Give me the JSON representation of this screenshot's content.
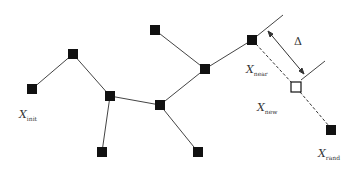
{
  "diagram": {
    "labels": {
      "x_init": {
        "main": "X",
        "sub": "init"
      },
      "x_near": {
        "main": "X",
        "sub": "near"
      },
      "x_new": {
        "main": "X",
        "sub": "new"
      },
      "x_rand": {
        "main": "X",
        "sub": "rand"
      },
      "delta": "Δ"
    },
    "nodes": [
      {
        "id": "n1",
        "x": 32,
        "y": 89
      },
      {
        "id": "n2",
        "x": 73,
        "y": 54
      },
      {
        "id": "n3",
        "x": 110,
        "y": 96
      },
      {
        "id": "n4",
        "x": 102,
        "y": 152
      },
      {
        "id": "n5",
        "x": 160,
        "y": 105
      },
      {
        "id": "n6",
        "x": 155,
        "y": 30
      },
      {
        "id": "n7",
        "x": 205,
        "y": 69
      },
      {
        "id": "n8",
        "x": 198,
        "y": 152
      },
      {
        "id": "x_near",
        "x": 252,
        "y": 40
      },
      {
        "id": "x_new",
        "x": 296,
        "y": 87,
        "hollow": true
      },
      {
        "id": "x_rand",
        "x": 331,
        "y": 130
      }
    ],
    "edges": [
      [
        "n1",
        "n2"
      ],
      [
        "n2",
        "n3"
      ],
      [
        "n3",
        "n4"
      ],
      [
        "n3",
        "n5"
      ],
      [
        "n5",
        "n7"
      ],
      [
        "n5",
        "n8"
      ],
      [
        "n6",
        "n7"
      ],
      [
        "n7",
        "x_near"
      ]
    ]
  }
}
